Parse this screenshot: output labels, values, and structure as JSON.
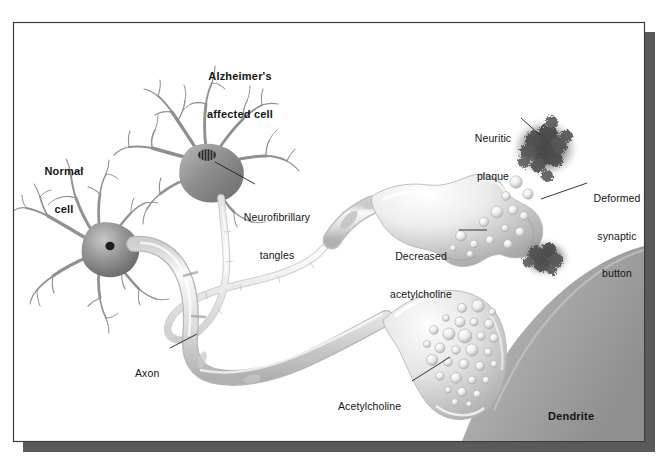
{
  "figure": {
    "background_color": "#ffffff",
    "frame": {
      "border_color": "#3c3c3c",
      "shadow_color": "#5a5a5a",
      "x": 13,
      "y": 22,
      "width": 632,
      "height": 420
    }
  },
  "palette": {
    "text": "#141414",
    "leader_line": "#1a1a1a",
    "cell_dark": "#6e6e6e",
    "cell_mid": "#9a9a9a",
    "cell_light": "#d6d6d6",
    "axon_fill": "#e3e3e3",
    "axon_stroke": "#b4b4b4",
    "terminal_light": "#f2f2f2",
    "terminal_shade": "#bcbcbc",
    "vesicle_light": "#fbfbfb",
    "vesicle_shade": "#c2c2c2",
    "plaque_dark": "#4a4a4a",
    "dendrite_gray": "#a8a8a8",
    "dendrite_gray_light": "#c9c9c9",
    "nucleus": "#222222"
  },
  "labels": [
    {
      "id": "normal-cell",
      "text": "Normal\ncell",
      "lines": [
        "Normal",
        "cell"
      ],
      "bold": true,
      "align": "center",
      "x": 32,
      "y": 140,
      "width": 64,
      "has_leader": false
    },
    {
      "id": "alzheimers-affected-cell",
      "text": "Alzheimer's\naffected cell",
      "lines": [
        "Alzheimer's",
        "affected cell"
      ],
      "bold": true,
      "align": "center",
      "x": 182,
      "y": 45,
      "width": 116,
      "has_leader": false
    },
    {
      "id": "neurofibrillary-tangles",
      "text": "Neurofibrillary\ntangles",
      "lines": [
        "Neurofibrillary",
        "tangles"
      ],
      "bold": false,
      "align": "center",
      "x": 236,
      "y": 186,
      "width": 82,
      "has_leader": true
    },
    {
      "id": "neuritic-plaque",
      "text": "Neuritic\nplaque",
      "lines": [
        "Neuritic",
        "plaque"
      ],
      "bold": false,
      "align": "center",
      "x": 465,
      "y": 107,
      "width": 56,
      "has_leader": true
    },
    {
      "id": "deformed-synaptic-button",
      "text": "Deformed\nsynaptic\nbutton",
      "lines": [
        "Deformed",
        "synaptic",
        "button"
      ],
      "bold": false,
      "align": "center",
      "x": 589,
      "y": 167,
      "width": 56,
      "has_leader": true
    },
    {
      "id": "decreased-acetylcholine",
      "text": "Decreased\nacetylcholine",
      "lines": [
        "Decreased",
        "acetylcholine"
      ],
      "bold": false,
      "align": "center",
      "x": 383,
      "y": 225,
      "width": 76,
      "has_leader": true
    },
    {
      "id": "axon",
      "text": "Axon",
      "lines": [
        "Axon"
      ],
      "bold": false,
      "align": "left",
      "x": 135,
      "y": 348,
      "width": 34,
      "has_leader": true
    },
    {
      "id": "acetylcholine",
      "text": "Acetylcholine",
      "lines": [
        "Acetylcholine"
      ],
      "bold": false,
      "align": "left",
      "x": 338,
      "y": 381,
      "width": 72,
      "has_leader": true
    },
    {
      "id": "dendrite",
      "text": "Dendrite",
      "lines": [
        "Dendrite"
      ],
      "bold": true,
      "align": "left",
      "x": 548,
      "y": 385,
      "width": 58,
      "has_leader": false
    }
  ],
  "structures": [
    {
      "id": "normal-cell-body",
      "name": "Normal neuron soma with dendrites"
    },
    {
      "id": "alzheimers-cell-body",
      "name": "Alzheimer's affected neuron soma with dendrites"
    },
    {
      "id": "neurofibrillary-tangle-nucleus",
      "name": "Striped nucleus showing tangles"
    },
    {
      "id": "normal-axon",
      "name": "Thick healthy axon"
    },
    {
      "id": "alzheimers-axon",
      "name": "Thin atrophied axon"
    },
    {
      "id": "upper-synaptic-terminal",
      "name": "Deformed synaptic button with few vesicles"
    },
    {
      "id": "lower-synaptic-terminal",
      "name": "Healthy synaptic button with many vesicles"
    },
    {
      "id": "neuritic-plaque-upper",
      "name": "Neuritic plaque cloud above terminal"
    },
    {
      "id": "neuritic-plaque-lower",
      "name": "Neuritic plaque cloud below terminal"
    },
    {
      "id": "dendrite-mass",
      "name": "Receiving dendrite surface"
    }
  ]
}
